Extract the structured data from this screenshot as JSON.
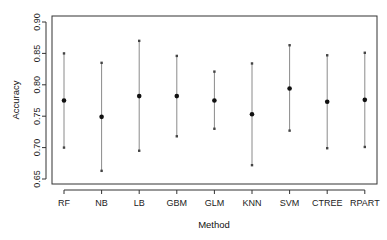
{
  "chart_data": {
    "type": "errorbar",
    "title": "",
    "xlabel": "Method",
    "ylabel": "Accuracy",
    "categories": [
      "RF",
      "NB",
      "LB",
      "GBM",
      "GLM",
      "KNN",
      "SVM",
      "CTREE",
      "RPART"
    ],
    "series": [
      {
        "name": "Accuracy",
        "values": [
          0.775,
          0.749,
          0.782,
          0.782,
          0.775,
          0.753,
          0.794,
          0.773,
          0.776
        ],
        "upper": [
          0.85,
          0.835,
          0.87,
          0.846,
          0.821,
          0.834,
          0.863,
          0.847,
          0.851
        ],
        "lower": [
          0.7,
          0.663,
          0.695,
          0.718,
          0.73,
          0.672,
          0.727,
          0.699,
          0.701
        ]
      }
    ],
    "ylim": [
      0.65,
      0.9
    ],
    "yticks": [
      "0.65",
      "0.70",
      "0.75",
      "0.80",
      "0.85",
      "0.90"
    ],
    "grid": false,
    "legend": "none"
  },
  "colors": {
    "point": "#111111",
    "bar": "#8a8a8a",
    "axis": "#333333"
  }
}
